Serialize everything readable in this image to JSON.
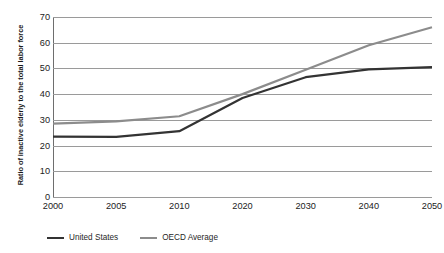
{
  "chart_data": {
    "type": "line",
    "title": "",
    "xlabel": "",
    "ylabel": "Ratio of inactive elderly to the total labor force",
    "categories": [
      "2000",
      "2005",
      "2010",
      "2020",
      "2030",
      "2040",
      "2050"
    ],
    "ylim": [
      0,
      70
    ],
    "ytick_labels": [
      "70",
      "60",
      "50",
      "40",
      "30",
      "20",
      "10",
      "0"
    ],
    "ytick_values": [
      70,
      60,
      50,
      40,
      30,
      20,
      10,
      0
    ],
    "grid": "horizontal",
    "legend_position": "bottom-left",
    "series": [
      {
        "name": "United States",
        "color": "#333333",
        "values": [
          23.5,
          23.4,
          25.6,
          38.5,
          46.6,
          49.6,
          50.5
        ]
      },
      {
        "name": "OECD Average",
        "color": "#8c8c8c",
        "values": [
          28.5,
          29.4,
          31.4,
          40.0,
          49.5,
          59.0,
          66.0
        ]
      }
    ]
  },
  "colors": {
    "united_states_line": "#333333",
    "oecd_average_line": "#8c8c8c",
    "gridline": "#9a9a9a",
    "axis": "#6e6e6e",
    "background": "#ffffff"
  }
}
